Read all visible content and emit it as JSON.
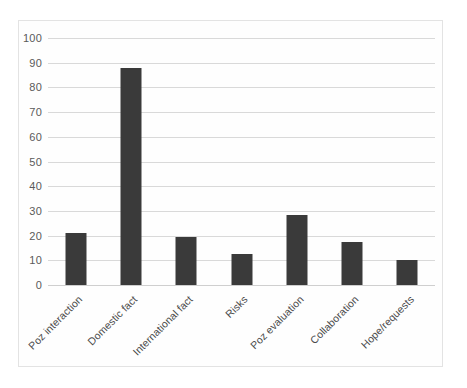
{
  "chart_data": {
    "type": "bar",
    "title": "",
    "subtitle": "",
    "xlabel": "",
    "ylabel": "",
    "categories": [
      "Poz interaction",
      "Domestic fact",
      "International fact",
      "Risks",
      "Poz evaluation",
      "Collaboration",
      "Hope/requests"
    ],
    "values": [
      21,
      88,
      19.5,
      12.5,
      28.5,
      17.5,
      10
    ],
    "ylim": [
      0,
      100
    ],
    "ytick_labels": [
      "0",
      "10",
      "20",
      "30",
      "40",
      "50",
      "60",
      "70",
      "80",
      "90",
      "100"
    ],
    "ytick_values": [
      0,
      10,
      20,
      30,
      40,
      50,
      60,
      70,
      80,
      90,
      100
    ],
    "grid": true,
    "grid_axis": "y",
    "legend": false,
    "legend_position": "none",
    "bar_color": "#3a3a3a",
    "gridline_color": "#d9d9d9",
    "plot_background": "#fefefe",
    "tick_label_color": "#5a5a5a",
    "category_label_rotation": -45,
    "annotations": []
  }
}
